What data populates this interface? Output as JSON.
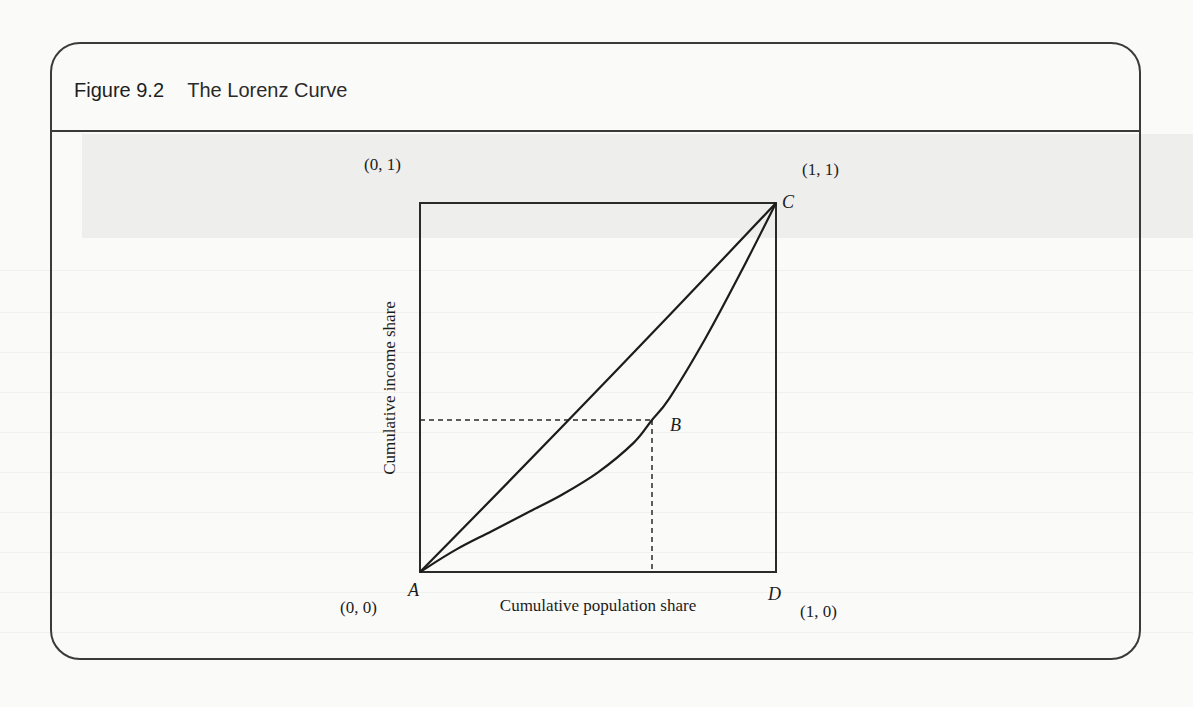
{
  "figure": {
    "number": "Figure 9.2",
    "title": "The Lorenz Curve"
  },
  "chart_data": {
    "type": "line",
    "title": "The Lorenz Curve",
    "xlabel": "Cumulative population share",
    "ylabel": "Cumulative income share",
    "xlim": [
      0,
      1
    ],
    "ylim": [
      0,
      1
    ],
    "grid": false,
    "legend": null,
    "series": [
      {
        "name": "Line of perfect equality (A to C)",
        "style": "solid",
        "x": [
          0,
          0.25,
          0.5,
          0.75,
          1
        ],
        "y": [
          0,
          0.24,
          0.485,
          0.735,
          1
        ]
      },
      {
        "name": "Lorenz curve (A to C through B)",
        "style": "solid",
        "x": [
          0,
          0.1,
          0.2,
          0.3,
          0.4,
          0.5,
          0.6,
          0.65,
          0.7,
          0.8,
          0.9,
          1
        ],
        "y": [
          0,
          0.06,
          0.11,
          0.16,
          0.21,
          0.27,
          0.35,
          0.41,
          0.47,
          0.63,
          0.81,
          1
        ]
      }
    ],
    "reference_lines": [
      {
        "name": "horizontal dashed from y-axis to B",
        "style": "dashed",
        "from": [
          0,
          0.41
        ],
        "to": [
          0.65,
          0.41
        ]
      },
      {
        "name": "vertical dashed from B to x-axis",
        "style": "dashed",
        "from": [
          0.65,
          0.41
        ],
        "to": [
          0.65,
          0
        ]
      }
    ],
    "points": [
      {
        "label": "A",
        "x": 0,
        "y": 0,
        "coord_label": "(0, 0)"
      },
      {
        "label": "B",
        "x": 0.65,
        "y": 0.41
      },
      {
        "label": "C",
        "x": 1,
        "y": 1,
        "coord_label": "(1, 1)"
      },
      {
        "label": "D",
        "x": 1,
        "y": 0,
        "coord_label": "(1, 0)"
      },
      {
        "label": "",
        "x": 0,
        "y": 1,
        "coord_label": "(0, 1)"
      }
    ],
    "annotations": [
      "(0, 1)",
      "(1, 1)",
      "(0, 0)",
      "(1, 0)",
      "A",
      "B",
      "C",
      "D"
    ]
  },
  "labels": {
    "coord_00": "(0, 0)",
    "coord_01": "(0, 1)",
    "coord_11": "(1, 1)",
    "coord_10": "(1, 0)",
    "point_a": "A",
    "point_b": "B",
    "point_c": "C",
    "point_d": "D",
    "xlabel": "Cumulative population share",
    "ylabel": "Cumulative income share"
  },
  "colors": {
    "ink": "#1c1c1c",
    "frame": "#3a3a3a",
    "paper": "#fafaf9"
  }
}
